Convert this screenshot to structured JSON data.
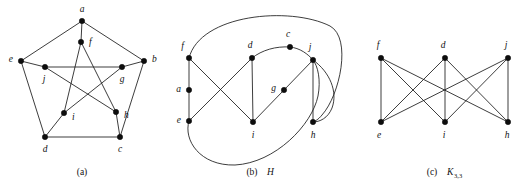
{
  "figure": {
    "background_color": "#ffffff",
    "ink_color": "#111111",
    "vertex_radius": 2.7,
    "panels": [
      {
        "id": "panel-a",
        "name": "petersen-graph",
        "caption": "(a)",
        "caption_name": "",
        "caption_sub": "",
        "caption_x": 82,
        "caption_y": 175,
        "vertices": [
          {
            "id": "a",
            "label": "a",
            "x": 82,
            "y": 21,
            "lx": 82,
            "ly": 10,
            "anchor": "middle"
          },
          {
            "id": "f",
            "label": "f",
            "x": 81,
            "y": 42,
            "lx": 89,
            "ly": 43,
            "anchor": "start"
          },
          {
            "id": "e",
            "label": "e",
            "x": 21,
            "y": 61,
            "lx": 13,
            "ly": 60,
            "anchor": "end"
          },
          {
            "id": "b",
            "label": "b",
            "x": 144,
            "y": 61,
            "lx": 152,
            "ly": 60,
            "anchor": "start"
          },
          {
            "id": "j",
            "label": "j",
            "x": 45,
            "y": 67,
            "lx": 44,
            "ly": 80,
            "anchor": "middle"
          },
          {
            "id": "g",
            "label": "g",
            "x": 122,
            "y": 67,
            "lx": 122,
            "ly": 80,
            "anchor": "middle"
          },
          {
            "id": "i",
            "label": "i",
            "x": 64,
            "y": 113,
            "lx": 72,
            "ly": 118,
            "anchor": "start"
          },
          {
            "id": "h",
            "label": "h",
            "x": 116,
            "y": 112,
            "lx": 124,
            "ly": 116,
            "anchor": "start"
          },
          {
            "id": "d",
            "label": "d",
            "x": 45,
            "y": 137,
            "lx": 45,
            "ly": 150,
            "anchor": "middle"
          },
          {
            "id": "c",
            "label": "c",
            "x": 120,
            "y": 137,
            "lx": 120,
            "ly": 150,
            "anchor": "middle"
          }
        ],
        "edges": [
          {
            "from": "a",
            "to": "e"
          },
          {
            "from": "a",
            "to": "b"
          },
          {
            "from": "a",
            "to": "f"
          },
          {
            "from": "e",
            "to": "d"
          },
          {
            "from": "b",
            "to": "c"
          },
          {
            "from": "d",
            "to": "c"
          },
          {
            "from": "e",
            "to": "j"
          },
          {
            "from": "b",
            "to": "g"
          },
          {
            "from": "d",
            "to": "i"
          },
          {
            "from": "c",
            "to": "h"
          },
          {
            "from": "j",
            "to": "g"
          },
          {
            "from": "j",
            "to": "h"
          },
          {
            "from": "g",
            "to": "i"
          },
          {
            "from": "f",
            "to": "i"
          },
          {
            "from": "f",
            "to": "h"
          }
        ]
      },
      {
        "id": "panel-b",
        "name": "graph-H",
        "caption": "(b)",
        "caption_name": "H",
        "caption_sub": "",
        "caption_x": 252,
        "caption_y": 175,
        "vertices": [
          {
            "id": "f",
            "label": "f",
            "x": 189,
            "y": 58,
            "lx": 184,
            "ly": 47,
            "anchor": "end"
          },
          {
            "id": "a",
            "label": "a",
            "x": 189,
            "y": 90,
            "lx": 181,
            "ly": 90,
            "anchor": "end"
          },
          {
            "id": "e",
            "label": "e",
            "x": 189,
            "y": 121,
            "lx": 181,
            "ly": 121,
            "anchor": "end"
          },
          {
            "id": "d",
            "label": "d",
            "x": 252,
            "y": 58,
            "lx": 250,
            "ly": 46,
            "anchor": "middle"
          },
          {
            "id": "c",
            "label": "c",
            "x": 290,
            "y": 47,
            "lx": 288,
            "ly": 35,
            "anchor": "middle"
          },
          {
            "id": "j",
            "label": "j",
            "x": 313,
            "y": 60,
            "lx": 310,
            "ly": 48,
            "anchor": "middle"
          },
          {
            "id": "g",
            "label": "g",
            "x": 284,
            "y": 90,
            "lx": 276,
            "ly": 89,
            "anchor": "end"
          },
          {
            "id": "i",
            "label": "i",
            "x": 253,
            "y": 122,
            "lx": 253,
            "ly": 136,
            "anchor": "middle"
          },
          {
            "id": "h",
            "label": "h",
            "x": 313,
            "y": 122,
            "lx": 313,
            "ly": 136,
            "anchor": "middle"
          }
        ],
        "edges": [
          {
            "from": "f",
            "to": "a",
            "type": "line"
          },
          {
            "from": "a",
            "to": "e",
            "type": "line"
          },
          {
            "from": "f",
            "to": "i",
            "type": "line"
          },
          {
            "from": "e",
            "to": "d",
            "type": "line"
          },
          {
            "from": "d",
            "to": "i",
            "type": "line"
          },
          {
            "from": "i",
            "to": "g",
            "type": "line"
          },
          {
            "from": "g",
            "to": "j",
            "type": "line"
          },
          {
            "from": "j",
            "to": "h",
            "type": "line"
          },
          {
            "from": "f",
            "to": "h",
            "type": "curve"
          },
          {
            "from": "d",
            "to": "c",
            "type": "curve"
          },
          {
            "from": "c",
            "to": "j",
            "type": "curve"
          },
          {
            "from": "e",
            "to": "j",
            "type": "curve"
          },
          {
            "from": "j",
            "to": "h",
            "type": "curve"
          }
        ]
      },
      {
        "id": "panel-c",
        "name": "k33-graph",
        "caption": "(c)",
        "caption_name": "K",
        "caption_sub": "3,3",
        "caption_x": 432,
        "caption_y": 175,
        "vertices": [
          {
            "id": "f",
            "label": "f",
            "x": 381,
            "y": 58,
            "lx": 378,
            "ly": 46,
            "anchor": "middle"
          },
          {
            "id": "d",
            "label": "d",
            "x": 445,
            "y": 58,
            "lx": 443,
            "ly": 46,
            "anchor": "middle"
          },
          {
            "id": "j",
            "label": "j",
            "x": 508,
            "y": 58,
            "lx": 506,
            "ly": 46,
            "anchor": "middle"
          },
          {
            "id": "e",
            "label": "e",
            "x": 381,
            "y": 122,
            "lx": 379,
            "ly": 136,
            "anchor": "middle"
          },
          {
            "id": "i",
            "label": "i",
            "x": 445,
            "y": 122,
            "lx": 444,
            "ly": 136,
            "anchor": "middle"
          },
          {
            "id": "h",
            "label": "h",
            "x": 508,
            "y": 122,
            "lx": 507,
            "ly": 136,
            "anchor": "middle"
          }
        ],
        "edges": [
          {
            "from": "f",
            "to": "e"
          },
          {
            "from": "f",
            "to": "i"
          },
          {
            "from": "f",
            "to": "h"
          },
          {
            "from": "d",
            "to": "e"
          },
          {
            "from": "d",
            "to": "i"
          },
          {
            "from": "d",
            "to": "h"
          },
          {
            "from": "j",
            "to": "e"
          },
          {
            "from": "j",
            "to": "i"
          },
          {
            "from": "j",
            "to": "h"
          }
        ]
      }
    ]
  },
  "chart_data": {
    "type": "diagram",
    "title": "",
    "subtitle": "",
    "graphs": [
      {
        "label": "(a)",
        "name": "Petersen graph",
        "vertex_count": 10,
        "edge_count": 15,
        "vertices": [
          "a",
          "b",
          "c",
          "d",
          "e",
          "f",
          "g",
          "h",
          "i",
          "j"
        ],
        "edges": [
          [
            "a",
            "e"
          ],
          [
            "a",
            "b"
          ],
          [
            "a",
            "f"
          ],
          [
            "e",
            "d"
          ],
          [
            "b",
            "c"
          ],
          [
            "d",
            "c"
          ],
          [
            "e",
            "j"
          ],
          [
            "b",
            "g"
          ],
          [
            "d",
            "i"
          ],
          [
            "c",
            "h"
          ],
          [
            "j",
            "g"
          ],
          [
            "j",
            "h"
          ],
          [
            "g",
            "i"
          ],
          [
            "f",
            "i"
          ],
          [
            "f",
            "h"
          ]
        ]
      },
      {
        "label": "(b)",
        "name": "H",
        "vertex_count": 9,
        "edge_count": 13,
        "vertices": [
          "a",
          "c",
          "d",
          "e",
          "f",
          "g",
          "h",
          "i",
          "j"
        ],
        "edges": [
          [
            "f",
            "a"
          ],
          [
            "a",
            "e"
          ],
          [
            "f",
            "i"
          ],
          [
            "e",
            "d"
          ],
          [
            "d",
            "i"
          ],
          [
            "i",
            "g"
          ],
          [
            "g",
            "j"
          ],
          [
            "j",
            "h"
          ],
          [
            "f",
            "h"
          ],
          [
            "d",
            "c"
          ],
          [
            "c",
            "j"
          ],
          [
            "e",
            "j"
          ],
          [
            "j",
            "h"
          ]
        ]
      },
      {
        "label": "(c)",
        "name": "K3,3",
        "vertex_count": 6,
        "edge_count": 9,
        "part_one": [
          "f",
          "d",
          "j"
        ],
        "part_two": [
          "e",
          "i",
          "h"
        ],
        "edges": [
          [
            "f",
            "e"
          ],
          [
            "f",
            "i"
          ],
          [
            "f",
            "h"
          ],
          [
            "d",
            "e"
          ],
          [
            "d",
            "i"
          ],
          [
            "d",
            "h"
          ],
          [
            "j",
            "e"
          ],
          [
            "j",
            "i"
          ],
          [
            "j",
            "h"
          ]
        ]
      }
    ]
  }
}
